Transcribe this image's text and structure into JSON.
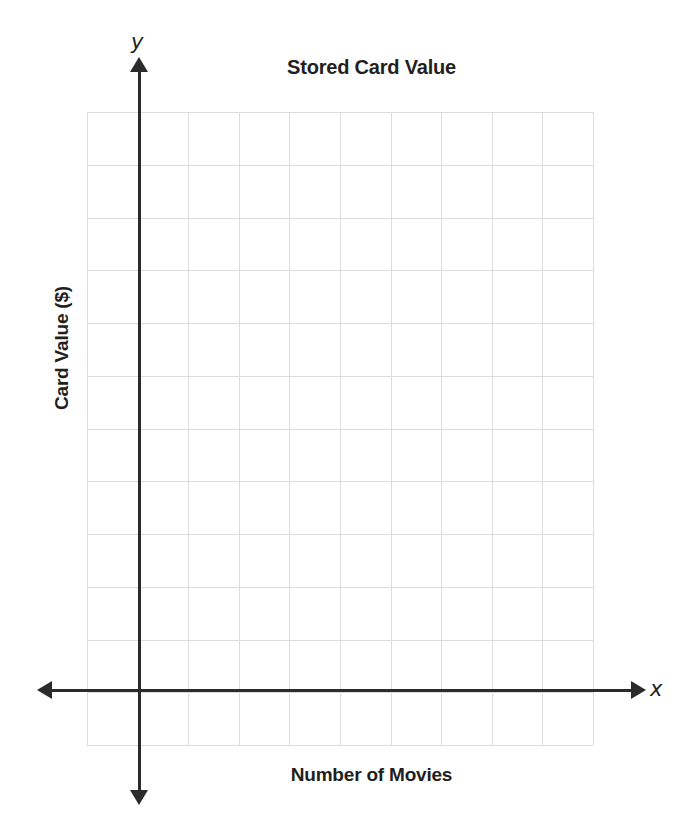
{
  "chart_data": {
    "type": "scatter",
    "title": "Stored Card Value",
    "xlabel": "Number of Movies",
    "ylabel": "Card Value ($)",
    "x_axis_letter": "x",
    "y_axis_letter": "y",
    "grid": true,
    "grid_columns": 10,
    "grid_rows": 12,
    "origin_column_index": 1,
    "origin_row_index": 11,
    "xlim": [
      -1,
      9
    ],
    "ylim": [
      -1,
      11
    ],
    "x_tick_labels": [],
    "y_tick_labels": [],
    "series": [],
    "x": [],
    "values": [],
    "annotations": [],
    "legend": null,
    "legend_position": "none"
  },
  "colors": {
    "background": "#ffffff",
    "grid_line": "#dcdcdc",
    "axis_line": "#2b2b2b",
    "text": "#231f20"
  }
}
